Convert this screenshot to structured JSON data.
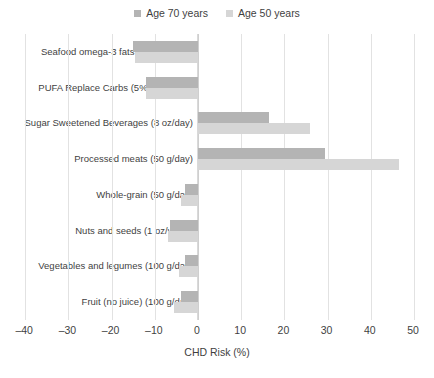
{
  "chart_data": {
    "type": "bar",
    "orientation": "horizontal",
    "title": "",
    "xlabel": "CHD Risk (%)",
    "ylabel": "",
    "xlim": [
      -40,
      50
    ],
    "xticks": [
      "–40",
      "–30",
      "–20",
      "–10",
      "0",
      "10",
      "20",
      "30",
      "40",
      "50"
    ],
    "xtick_values": [
      -40,
      -30,
      -20,
      -10,
      0,
      10,
      20,
      30,
      40,
      50
    ],
    "grid": true,
    "legend_position": "top-center",
    "categories": [
      "Seafood omega-3 fats (100 mg/day)",
      "PUFA Replace Carbs (5% kcals/day)",
      "Sugar Sweetened Beverages (8 oz/day)",
      "Processed meats (50 g/day)",
      "Whole-grain (50 g/day)",
      "Nuts and seeds (1 oz/week)",
      "Vegetables and legumes (100 g/day)",
      "Fruit (no juice) (100 g/day)"
    ],
    "series": [
      {
        "name": "Age 70 years",
        "color": "#b4b4b4",
        "values": [
          -15.0,
          -12.0,
          16.5,
          29.5,
          -3.0,
          -6.5,
          -3.0,
          -4.0
        ]
      },
      {
        "name": "Age 50 years",
        "color": "#d6d6d6",
        "values": [
          -14.5,
          -12.0,
          26.0,
          46.5,
          -4.0,
          -7.0,
          -4.5,
          -5.5
        ]
      }
    ]
  },
  "legend": {
    "items": [
      {
        "label": "Age 70 years",
        "color": "#b4b4b4"
      },
      {
        "label": "Age 50 years",
        "color": "#d6d6d6"
      }
    ]
  },
  "axis": {
    "x_title": "CHD Risk (%)"
  }
}
